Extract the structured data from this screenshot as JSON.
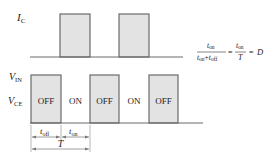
{
  "diagram": {
    "upper_signal": {
      "label_main": "I",
      "label_sub": "C",
      "pulses": [
        {
          "x": 60,
          "w": 30
        },
        {
          "x": 119,
          "w": 30
        }
      ],
      "top_y": 14,
      "baseline_y": 57,
      "baseline_x1": 30,
      "baseline_x2": 183
    },
    "lower_signal": {
      "top_label_main": "V",
      "top_label_sub": "IN",
      "label_main": "V",
      "label_sub": "CE",
      "pulses": [
        {
          "x": 31,
          "w": 30,
          "label": "OFF"
        },
        {
          "x": 90,
          "w": 29,
          "label": "OFF"
        },
        {
          "x": 149,
          "w": 29,
          "label": "OFF"
        }
      ],
      "gaps": [
        {
          "x": 75,
          "label": "ON"
        },
        {
          "x": 134,
          "label": "ON"
        }
      ],
      "top_y": 75,
      "baseline_y": 123,
      "baseline_x1": 30,
      "baseline_x2": 203
    },
    "dimensions": {
      "t_off": {
        "main": "t",
        "sub": "off"
      },
      "t_on": {
        "main": "t",
        "sub": "on"
      },
      "period": "T"
    },
    "formula": {
      "num1_main": "t",
      "num1_sub": "on",
      "den1_a_main": "t",
      "den1_a_sub": "on",
      "plus": "+",
      "den1_b_main": "t",
      "den1_b_sub": "off",
      "eq1": "=",
      "num2_main": "t",
      "num2_sub": "on",
      "den2": "T",
      "eq2": "=",
      "result": "D"
    }
  }
}
